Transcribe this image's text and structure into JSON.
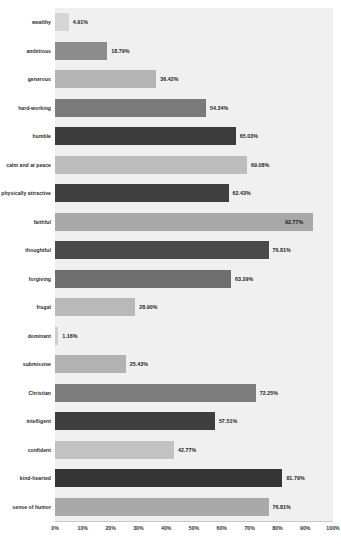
{
  "chart_data": {
    "type": "bar",
    "orientation": "horizontal",
    "title": "",
    "subtitle": "",
    "xlabel": "",
    "ylabel": "",
    "xlim": [
      0,
      100
    ],
    "grid": false,
    "legend": null,
    "value_suffix": "%",
    "xticks": [
      "0%",
      "10%",
      "20%",
      "30%",
      "40%",
      "50%",
      "60%",
      "70%",
      "80%",
      "90%",
      "100%"
    ],
    "xtick_values": [
      0,
      10,
      20,
      30,
      40,
      50,
      60,
      70,
      80,
      90,
      100
    ],
    "categories": [
      "wealthy",
      "ambitious",
      "generous",
      "hard-working",
      "humble",
      "calm and at peace",
      "physically attractive",
      "faithful",
      "thoughtful",
      "forgiving",
      "frugal",
      "dominant",
      "submissive",
      "Christian",
      "intelligent",
      "confident",
      "kind-hearted",
      "sense of humor"
    ],
    "values": [
      4.91,
      18.79,
      36.42,
      54.34,
      65.03,
      69.08,
      62.43,
      92.77,
      76.81,
      63.29,
      28.9,
      1.16,
      25.43,
      72.25,
      57.51,
      42.77,
      81.79,
      76.81
    ],
    "labels": [
      "4.91%",
      "18.79%",
      "36.42%",
      "54.34%",
      "65.03%",
      "69.08%",
      "62.43%",
      "92.77%",
      "76.81%",
      "63.29%",
      "28.90%",
      "1.16%",
      "25.43%",
      "72.25%",
      "57.51%",
      "42.77%",
      "81.79%",
      "76.81%"
    ],
    "bar_colors": [
      "#d5d5d5",
      "#8c8c8c",
      "#b4b4b4",
      "#7a7a7a",
      "#3c3c3c",
      "#bdbdbd",
      "#3f3f3f",
      "#a8a8a8",
      "#4a4a4a",
      "#6e6e6e",
      "#b9b9b9",
      "#cfcfcf",
      "#b2b2b2",
      "#7c7c7c",
      "#3e3e3e",
      "#c2c2c2",
      "#353535",
      "#a9a9a9"
    ]
  },
  "colors": {
    "panel_background": "#f0f0f0",
    "page_background": "#ffffff",
    "axis_line": "#c8c8c8",
    "label_text": "#2b2b2b",
    "value_text": "#1c1c1c"
  }
}
